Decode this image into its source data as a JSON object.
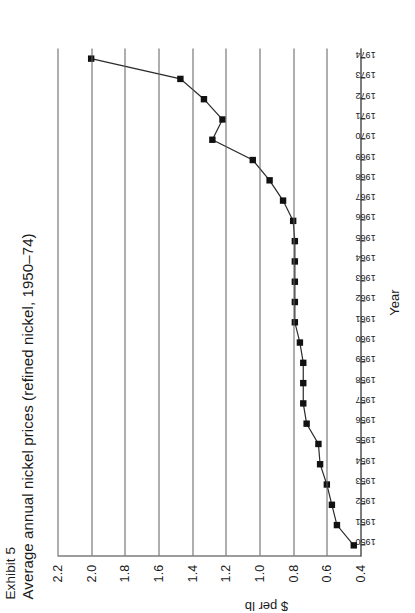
{
  "figure": {
    "exhibit_label": "Exhibit 5",
    "title": "Average annual nickel prices (refined nickel, 1950–74)"
  },
  "axes": {
    "y_title": "$ per lb",
    "x_title": "Year",
    "y_ticks": [
      "2.2",
      "2.0",
      "1.8",
      "1.6",
      "1.4",
      "1.2",
      "1.0",
      "0.8",
      "0.6",
      "0.4"
    ],
    "x_ticks": [
      "1950",
      "1951",
      "1952",
      "1953",
      "1954",
      "1955",
      "1956",
      "1957",
      "1958",
      "1959",
      "1960",
      "1961",
      "1962",
      "1963",
      "1964",
      "1965",
      "1966",
      "1967",
      "1968",
      "1969",
      "1970",
      "1971",
      "1972",
      "1973",
      "1974"
    ]
  },
  "style": {
    "line_color": "#2b2b2b",
    "marker_color": "#111111",
    "grid_color": "#5e5e5e",
    "axis_color": "#3a3a3a"
  },
  "chart_data": {
    "type": "line",
    "title": "Average annual nickel prices (refined nickel, 1950–74)",
    "xlabel": "Year",
    "ylabel": "$ per lb",
    "ylim": [
      0.4,
      2.2
    ],
    "ytick_step": 0.2,
    "grid": true,
    "legend": "none",
    "marker": "filled-square",
    "x": [
      1950,
      1951,
      1952,
      1953,
      1954,
      1955,
      1956,
      1957,
      1958,
      1959,
      1960,
      1961,
      1962,
      1963,
      1964,
      1965,
      1966,
      1967,
      1968,
      1969,
      1970,
      1971,
      1972,
      1973,
      1974
    ],
    "values": [
      0.44,
      0.54,
      0.57,
      0.6,
      0.64,
      0.65,
      0.72,
      0.74,
      0.74,
      0.74,
      0.76,
      0.79,
      0.79,
      0.79,
      0.79,
      0.79,
      0.8,
      0.86,
      0.94,
      1.04,
      1.28,
      1.22,
      1.33,
      1.47,
      2.0
    ],
    "series": [
      {
        "name": "Refined nickel price",
        "values": [
          0.44,
          0.54,
          0.57,
          0.6,
          0.64,
          0.65,
          0.72,
          0.74,
          0.74,
          0.74,
          0.76,
          0.79,
          0.79,
          0.79,
          0.79,
          0.79,
          0.8,
          0.86,
          0.94,
          1.04,
          1.28,
          1.22,
          1.33,
          1.47,
          2.0
        ]
      }
    ]
  }
}
